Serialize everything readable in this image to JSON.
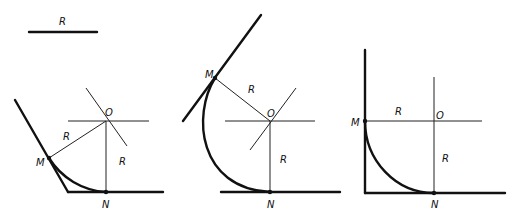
{
  "reference": {
    "label": "R"
  },
  "panels": [
    {
      "name": "acute-angle",
      "labels": {
        "center": "O",
        "tangent_point_1": "M",
        "tangent_point_2": "N",
        "radius_1": "R",
        "radius_2": "R"
      }
    },
    {
      "name": "obtuse-angle",
      "labels": {
        "center": "O",
        "tangent_point_1": "M",
        "tangent_point_2": "N",
        "radius_1": "R",
        "radius_2": "R"
      }
    },
    {
      "name": "right-angle",
      "labels": {
        "center": "O",
        "tangent_point_1": "M",
        "tangent_point_2": "N",
        "radius_1": "R",
        "radius_2": "R"
      }
    }
  ],
  "colors": {
    "line": "#111111",
    "background": "#ffffff"
  }
}
